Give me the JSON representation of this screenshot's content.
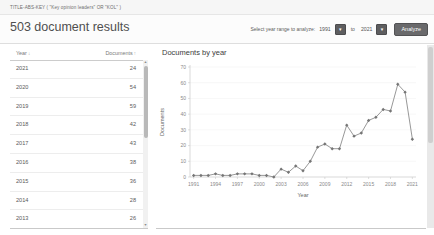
{
  "query_bar": {
    "query": "TITLE-ABS-KEY ( \"Key opinion leaders\" OR \"KOL\" )"
  },
  "header": {
    "results_count": "503 document results",
    "year_range": {
      "label": "Select year range to analyze:",
      "from_value": "1991",
      "to_label": "to",
      "to_value": "2021",
      "dropdown_icon": "▾",
      "analyze_label": "Analyze"
    }
  },
  "table": {
    "columns": [
      {
        "label": "Year",
        "sort_icon": "↓"
      },
      {
        "label": "Documents",
        "sort_icon": "↑"
      }
    ],
    "rows": [
      {
        "year": "2021",
        "documents": "24"
      },
      {
        "year": "2020",
        "documents": "54"
      },
      {
        "year": "2019",
        "documents": "59"
      },
      {
        "year": "2018",
        "documents": "42"
      },
      {
        "year": "2017",
        "documents": "43"
      },
      {
        "year": "2016",
        "documents": "38"
      },
      {
        "year": "2015",
        "documents": "36"
      },
      {
        "year": "2014",
        "documents": "28"
      },
      {
        "year": "2013",
        "documents": "26"
      },
      {
        "year": "2012",
        "documents": "33"
      }
    ]
  },
  "chart": {
    "title": "Documents by year"
  },
  "chart_data": {
    "type": "line",
    "title": "Documents by year",
    "xlabel": "Year",
    "ylabel": "Documents",
    "x": [
      1991,
      1992,
      1993,
      1994,
      1995,
      1996,
      1997,
      1998,
      1999,
      2000,
      2001,
      2002,
      2003,
      2004,
      2005,
      2006,
      2007,
      2008,
      2009,
      2010,
      2011,
      2012,
      2013,
      2014,
      2015,
      2016,
      2017,
      2018,
      2019,
      2020,
      2021
    ],
    "values": [
      1,
      1,
      1,
      2,
      1,
      1,
      2,
      2,
      2,
      1,
      1,
      0,
      5,
      3,
      7,
      4,
      10,
      19,
      21,
      18,
      18,
      33,
      26,
      28,
      36,
      38,
      43,
      42,
      59,
      54,
      24
    ],
    "ylim": [
      0,
      70
    ],
    "x_ticks": [
      1991,
      1994,
      1997,
      2000,
      2003,
      2006,
      2009,
      2012,
      2015,
      2018,
      2021
    ],
    "y_ticks": [
      0,
      10,
      20,
      30,
      40,
      50,
      60,
      70
    ],
    "grid": true,
    "legend": "none",
    "line_color": "#8c8c8c",
    "marker_color": "#757575"
  },
  "colors": {
    "button_bg": "#69696b",
    "button_text": "#ffffff",
    "header_border": "#dedede",
    "axis": "#c9c9c9",
    "grid": "#f2f2f2"
  }
}
